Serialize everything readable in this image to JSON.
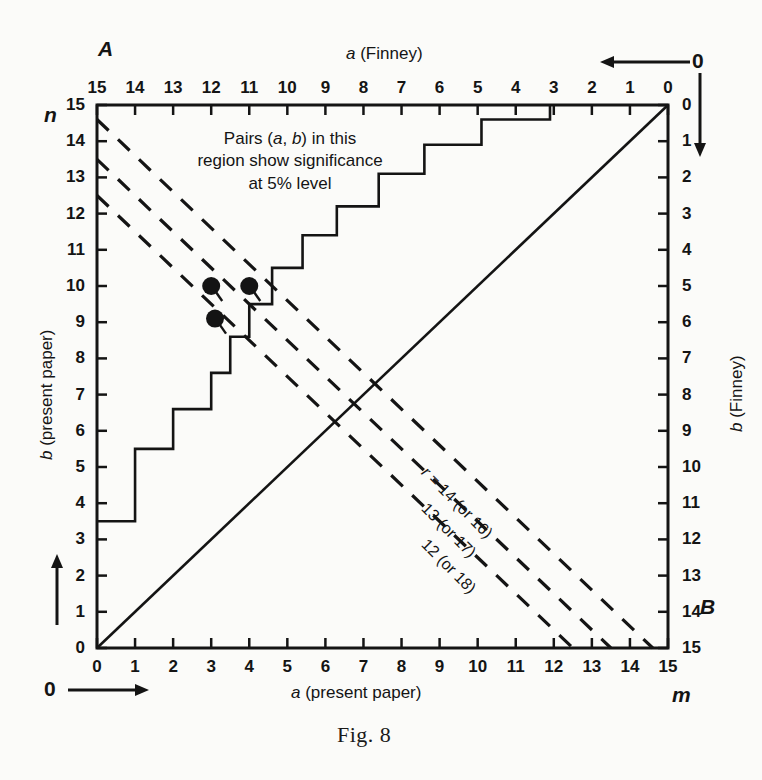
{
  "figure": {
    "caption": "Fig. 8",
    "corner_label_top_left": "A",
    "corner_label_bottom_right": "B",
    "left_symbol_top": "n",
    "bottom_symbol_right": "m",
    "origin_zero_top_right": "0",
    "origin_zero_bottom_left": "0"
  },
  "annotation": {
    "line1": "Pairs (a, b) in this",
    "line2": "region show significance",
    "line3": "at 5% level"
  },
  "axes": {
    "top": {
      "title": "a (Finney)",
      "title_italic": "a",
      "title_rest": " (Finney)",
      "ticks": [
        "15",
        "14",
        "13",
        "12",
        "11",
        "10",
        "9",
        "8",
        "7",
        "6",
        "5",
        "4",
        "3",
        "2",
        "1",
        "0"
      ],
      "direction": "decreasing-left-to-right-reversed"
    },
    "bottom": {
      "title": "a (present paper)",
      "title_italic": "a",
      "title_rest": " (present paper)",
      "ticks": [
        "0",
        "1",
        "2",
        "3",
        "4",
        "5",
        "6",
        "7",
        "8",
        "9",
        "10",
        "11",
        "12",
        "13",
        "14",
        "15"
      ],
      "direction": "increasing-left-to-right"
    },
    "left": {
      "title": "b (present paper)",
      "title_italic": "b",
      "title_rest": " (present paper)",
      "ticks": [
        "15",
        "14",
        "13",
        "12",
        "11",
        "10",
        "9",
        "8",
        "7",
        "6",
        "5",
        "4",
        "3",
        "2",
        "1",
        "0"
      ],
      "direction": "increasing-upward"
    },
    "right": {
      "title": "b (Finney)",
      "title_italic": "b",
      "title_rest": " (Finney)",
      "ticks": [
        "0",
        "1",
        "2",
        "3",
        "4",
        "5",
        "6",
        "7",
        "8",
        "9",
        "10",
        "11",
        "12",
        "13",
        "14",
        "15"
      ],
      "direction": "increasing-downward"
    }
  },
  "diagonal_labels": [
    {
      "id": "r14",
      "text": "r = 14 (or 16)",
      "prefix_italic": "r",
      "rest": " = 14 (or 16)"
    },
    {
      "id": "r13",
      "text": "13 (or 17)",
      "prefix_italic": "",
      "rest": "13 (or 17)"
    },
    {
      "id": "r12",
      "text": "12 (or 18)",
      "prefix_italic": "",
      "rest": "12 (or 18)"
    }
  ],
  "chart_data": {
    "type": "line",
    "title": "Fig. 8",
    "xlabel": "a (present paper)",
    "ylabel": "b (present paper)",
    "xlabel_secondary": "a (Finney)",
    "ylabel_secondary": "b (Finney)",
    "xlim": [
      0,
      15
    ],
    "ylim": [
      0,
      15
    ],
    "grid": false,
    "legend": "none",
    "series": [
      {
        "name": "5% significance boundary (step function)",
        "style": "solid-step",
        "points": [
          [
            0,
            3.5
          ],
          [
            1,
            3.5
          ],
          [
            1,
            5.5
          ],
          [
            2,
            5.5
          ],
          [
            2,
            6.6
          ],
          [
            3,
            6.6
          ],
          [
            3,
            7.6
          ],
          [
            3.5,
            7.6
          ],
          [
            3.5,
            8.6
          ],
          [
            4,
            8.6
          ],
          [
            4,
            9.5
          ],
          [
            4.6,
            9.5
          ],
          [
            4.6,
            10.5
          ],
          [
            5.4,
            10.5
          ],
          [
            5.4,
            11.4
          ],
          [
            6.3,
            11.4
          ],
          [
            6.3,
            12.2
          ],
          [
            7.4,
            12.2
          ],
          [
            7.4,
            13.1
          ],
          [
            8.6,
            13.1
          ],
          [
            8.6,
            13.9
          ],
          [
            10.1,
            13.9
          ],
          [
            10.1,
            14.6
          ],
          [
            11.9,
            14.6
          ],
          [
            11.9,
            15.0
          ]
        ]
      },
      {
        "name": "identity line a = b",
        "style": "solid",
        "points": [
          [
            0,
            0
          ],
          [
            15,
            15
          ]
        ]
      },
      {
        "name": "r = 14 (or 16)",
        "style": "dashed",
        "points": [
          [
            0,
            12.5
          ],
          [
            12.5,
            0
          ]
        ]
      },
      {
        "name": "r = 13 (or 17)",
        "style": "dashed",
        "points": [
          [
            0,
            13.5
          ],
          [
            13.5,
            0
          ]
        ]
      },
      {
        "name": "r = 12 (or 18)",
        "style": "dashed",
        "points": [
          [
            0,
            14.6
          ],
          [
            14.6,
            0
          ]
        ]
      }
    ],
    "markers": [
      {
        "label": "point-1",
        "x": 3.0,
        "y": 10.0
      },
      {
        "label": "point-2",
        "x": 4.0,
        "y": 10.0
      },
      {
        "label": "point-3",
        "x": 3.1,
        "y": 9.1
      }
    ],
    "annotations": [
      {
        "text": "Pairs (a, b) in this region show significance at 5% level",
        "x": 4.3,
        "y": 14.0
      },
      {
        "text": "r = 14 (or 16)",
        "x": 11.0,
        "y": 4.0
      },
      {
        "text": "13 (or 17)",
        "x": 11.6,
        "y": 3.1
      },
      {
        "text": "12 (or 18)",
        "x": 12.2,
        "y": 2.2
      }
    ]
  },
  "colors": {
    "ink": "#141414",
    "paper": "#fbfbf9"
  }
}
